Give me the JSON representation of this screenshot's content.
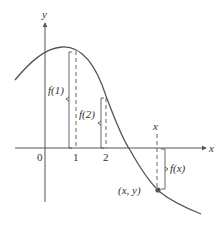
{
  "figure": {
    "axes": {
      "x_label": "x",
      "y_label": "y",
      "origin_label": "0",
      "ticks": [
        {
          "label": "1"
        },
        {
          "label": "2"
        }
      ]
    },
    "annotations": {
      "f1": "f(1)",
      "f2": "f(2)",
      "fx": "f(x)",
      "x_marker": "x",
      "point": "(x, y)"
    },
    "colors": {
      "curve": "#555555",
      "axes": "#555555",
      "text": "#333333",
      "point": "#555555"
    }
  }
}
